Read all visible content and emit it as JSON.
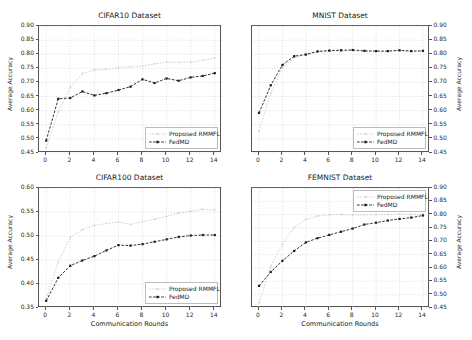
{
  "figure": {
    "series_names": [
      "Proposed RMMFL",
      "FedMD"
    ],
    "xlabel": "Communication Rounds",
    "ylabel": "Average Accuracy",
    "colors": {
      "rmmfl": "#cccccc",
      "fedmd": "#1b1b1b",
      "grid": "#cfcfcf",
      "axis": "#555555"
    }
  },
  "chart_data": [
    {
      "type": "line",
      "title": "CIFAR10 Dataset",
      "xlabel": "",
      "ylabel": "Average Accuracy",
      "xlim": [
        -0.6,
        14.6
      ],
      "ylim": [
        0.45,
        0.9
      ],
      "yticks": [
        0.45,
        0.5,
        0.55,
        0.6,
        0.65,
        0.7,
        0.75,
        0.8,
        0.85,
        0.9
      ],
      "ytick_labels": [
        "0.45",
        "0.50",
        "0.55",
        "0.60",
        "0.65",
        "0.70",
        "0.75",
        "0.80",
        "0.85",
        "0.90"
      ],
      "xticks": [
        0,
        2,
        4,
        6,
        8,
        10,
        12,
        14
      ],
      "xtick_labels": [
        "0",
        "2",
        "4",
        "6",
        "8",
        "10",
        "12",
        "14"
      ],
      "yaxis_side": "left",
      "legend_position": "lower right",
      "grid": true,
      "x": [
        0,
        1,
        2,
        3,
        4,
        5,
        6,
        7,
        8,
        9,
        10,
        11,
        12,
        13,
        14
      ],
      "series": [
        {
          "name": "Proposed RMMFL",
          "values": [
            0.468,
            0.596,
            0.683,
            0.731,
            0.744,
            0.747,
            0.752,
            0.756,
            0.758,
            0.766,
            0.772,
            0.771,
            0.772,
            0.778,
            0.787
          ]
        },
        {
          "name": "FedMD",
          "values": [
            0.494,
            0.642,
            0.645,
            0.668,
            0.654,
            0.662,
            0.673,
            0.685,
            0.711,
            0.698,
            0.714,
            0.706,
            0.718,
            0.723,
            0.733
          ]
        }
      ]
    },
    {
      "type": "line",
      "title": "MNIST Dataset",
      "xlabel": "",
      "ylabel": "Average Accuracy",
      "xlim": [
        -0.6,
        14.6
      ],
      "ylim": [
        0.45,
        0.9
      ],
      "yticks": [
        0.45,
        0.5,
        0.55,
        0.6,
        0.65,
        0.7,
        0.75,
        0.8,
        0.85,
        0.9
      ],
      "ytick_labels": [
        "0.45",
        "0.50",
        "0.55",
        "0.60",
        "0.65",
        "0.70",
        "0.75",
        "0.80",
        "0.85",
        "0.90"
      ],
      "xticks": [
        0,
        2,
        4,
        6,
        8,
        10,
        12,
        14
      ],
      "xtick_labels": [
        "0",
        "2",
        "4",
        "6",
        "8",
        "10",
        "12",
        "14"
      ],
      "yaxis_side": "right",
      "legend_position": "lower right",
      "grid": true,
      "x": [
        0,
        1,
        2,
        3,
        4,
        5,
        6,
        7,
        8,
        9,
        10,
        11,
        12,
        13,
        14
      ],
      "series": [
        {
          "name": "Proposed RMMFL",
          "values": [
            0.528,
            0.662,
            0.752,
            0.788,
            0.798,
            0.808,
            0.81,
            0.812,
            0.813,
            0.81,
            0.81,
            0.81,
            0.812,
            0.81,
            0.811
          ]
        },
        {
          "name": "FedMD",
          "values": [
            0.592,
            0.69,
            0.762,
            0.793,
            0.799,
            0.81,
            0.813,
            0.814,
            0.815,
            0.812,
            0.811,
            0.811,
            0.814,
            0.811,
            0.812
          ]
        }
      ]
    },
    {
      "type": "line",
      "title": "CIFAR100 Dataset",
      "xlabel": "Communication Rounds",
      "ylabel": "Average Accuracy",
      "xlim": [
        -0.6,
        14.6
      ],
      "ylim": [
        0.35,
        0.6
      ],
      "yticks": [
        0.35,
        0.4,
        0.45,
        0.5,
        0.55,
        0.6
      ],
      "ytick_labels": [
        "0.35",
        "0.40",
        "0.45",
        "0.50",
        "0.55",
        "0.60"
      ],
      "xticks": [
        0,
        2,
        4,
        6,
        8,
        10,
        12,
        14
      ],
      "xtick_labels": [
        "0",
        "2",
        "4",
        "6",
        "8",
        "10",
        "12",
        "14"
      ],
      "yaxis_side": "left",
      "legend_position": "lower right",
      "grid": true,
      "x": [
        0,
        1,
        2,
        3,
        4,
        5,
        6,
        7,
        8,
        9,
        10,
        11,
        12,
        13,
        14
      ],
      "series": [
        {
          "name": "Proposed RMMFL",
          "values": [
            0.369,
            0.446,
            0.497,
            0.513,
            0.522,
            0.526,
            0.529,
            0.524,
            0.53,
            0.535,
            0.541,
            0.548,
            0.551,
            0.556,
            0.554
          ]
        },
        {
          "name": "FedMD",
          "values": [
            0.365,
            0.413,
            0.438,
            0.449,
            0.458,
            0.47,
            0.481,
            0.48,
            0.483,
            0.488,
            0.493,
            0.498,
            0.501,
            0.502,
            0.502
          ]
        }
      ]
    },
    {
      "type": "line",
      "title": "FEMNIST Dataset",
      "xlabel": "Communication Rounds",
      "ylabel": "Average Accuracy",
      "xlim": [
        -0.6,
        14.6
      ],
      "ylim": [
        0.45,
        0.9
      ],
      "yticks": [
        0.45,
        0.5,
        0.55,
        0.6,
        0.65,
        0.7,
        0.75,
        0.8,
        0.85,
        0.9
      ],
      "ytick_labels": [
        "0.45",
        "0.50",
        "0.55",
        "0.60",
        "0.65",
        "0.70",
        "0.75",
        "0.80",
        "0.85",
        "0.90"
      ],
      "xticks": [
        0,
        2,
        4,
        6,
        8,
        10,
        12,
        14
      ],
      "xtick_labels": [
        "0",
        "2",
        "4",
        "6",
        "8",
        "10",
        "12",
        "14"
      ],
      "yaxis_side": "right",
      "legend_position": "upper right",
      "grid": true,
      "x": [
        0,
        1,
        2,
        3,
        4,
        5,
        6,
        7,
        8,
        9,
        10,
        11,
        12,
        13,
        14
      ],
      "series": [
        {
          "name": "Proposed RMMFL",
          "values": [
            0.47,
            0.606,
            0.69,
            0.752,
            0.782,
            0.795,
            0.8,
            0.801,
            0.799,
            0.8,
            0.8,
            0.801,
            0.802,
            0.801,
            0.802
          ]
        },
        {
          "name": "FedMD",
          "values": [
            0.533,
            0.585,
            0.627,
            0.664,
            0.696,
            0.712,
            0.724,
            0.736,
            0.748,
            0.763,
            0.77,
            0.778,
            0.784,
            0.789,
            0.797
          ]
        }
      ]
    }
  ]
}
